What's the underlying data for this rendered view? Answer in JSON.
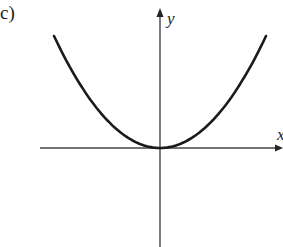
{
  "panel": {
    "label": "c)"
  },
  "axes": {
    "x_label": "x",
    "y_label": "y"
  },
  "colors": {
    "curve": "#1a1a1a",
    "axis": "#444444",
    "background": "#ffffff"
  },
  "chart_data": {
    "type": "line",
    "title": "",
    "panel_label": "c)",
    "xlabel": "x",
    "ylabel": "y",
    "x": [
      -1.0,
      -0.75,
      -0.5,
      -0.25,
      0.0,
      0.25,
      0.5,
      0.75,
      1.0
    ],
    "y": [
      1.0,
      0.5625,
      0.25,
      0.0625,
      0.0,
      0.0625,
      0.25,
      0.5625,
      1.0
    ],
    "xlim": [
      -1.1,
      1.1
    ],
    "ylim": [
      -0.9,
      1.2
    ],
    "grid": false,
    "legend": null,
    "ticks": "none"
  }
}
